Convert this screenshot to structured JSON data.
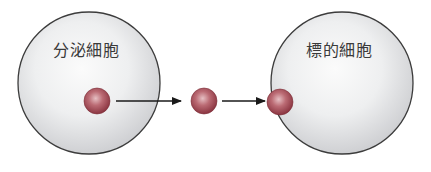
{
  "diagram": {
    "title": "",
    "colors": {
      "cell_fill_center": "#fbfbfb",
      "cell_fill_edge": "#d2d3d5",
      "cell_outline": "#3c3c3c",
      "molecule_highlight": "#e3b7bb",
      "molecule_mid": "#b5606a",
      "molecule_dark": "#8a3440",
      "arrow": "#1a1a1a",
      "label_text": "#3a3a3a"
    },
    "cells": [
      {
        "id": "secretory-cell",
        "label": "分泌細胞",
        "cx": 89,
        "cy": 83,
        "r": 71,
        "label_x": 53,
        "label_y": 42
      },
      {
        "id": "target-cell",
        "label": "標的細胞",
        "cx": 342,
        "cy": 83,
        "r": 71,
        "label_x": 306,
        "label_y": 42
      }
    ],
    "molecules": [
      {
        "id": "molecule-in-secretory-cell",
        "cx": 97,
        "cy": 101,
        "r": 13
      },
      {
        "id": "molecule-in-transit",
        "cx": 204,
        "cy": 101,
        "r": 13
      },
      {
        "id": "molecule-bound-to-target",
        "cx": 280,
        "cy": 102,
        "r": 13
      }
    ],
    "arrows": [
      {
        "id": "arrow-secretion",
        "x1": 116,
        "y1": 101,
        "x2": 181,
        "y2": 101
      },
      {
        "id": "arrow-to-target",
        "x1": 222,
        "y1": 101,
        "x2": 265,
        "y2": 101
      }
    ]
  }
}
